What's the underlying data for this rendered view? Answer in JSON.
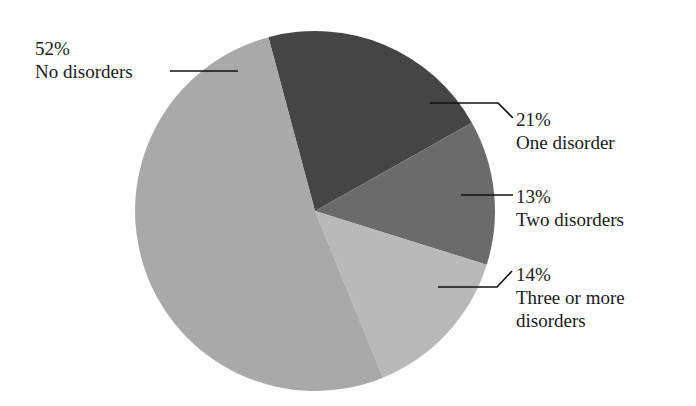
{
  "chart_data": {
    "type": "pie",
    "title": "",
    "start_angle_deg": -15,
    "direction": "clockwise",
    "slices": [
      {
        "key": "one",
        "label": "One disorder",
        "value": 21,
        "display": "21%",
        "color": "#454545"
      },
      {
        "key": "two",
        "label": "Two disorders",
        "value": 13,
        "display": "13%",
        "color": "#6b6b6b"
      },
      {
        "key": "three",
        "label": "Three or more disorders",
        "value": 14,
        "display": "14%",
        "color": "#b9b9b9"
      },
      {
        "key": "no",
        "label": "No disorders",
        "value": 52,
        "display": "52%",
        "color": "#a9a9a9"
      }
    ],
    "categories": [
      "One disorder",
      "Two disorders",
      "Three or more disorders",
      "No disorders"
    ],
    "values": [
      21,
      13,
      14,
      52
    ],
    "unit": "%",
    "legend": "none (direct labels with leader lines)"
  },
  "labels": {
    "no": {
      "pct": "52%",
      "name": "No disorders"
    },
    "one": {
      "pct": "21%",
      "name": "One disorder"
    },
    "two": {
      "pct": "13%",
      "name": "Two disorders"
    },
    "three": {
      "pct": "14%",
      "name_line1": "Three or more",
      "name_line2": "disorders"
    }
  },
  "geometry": {
    "cx": 315,
    "cy": 211,
    "r": 180
  }
}
